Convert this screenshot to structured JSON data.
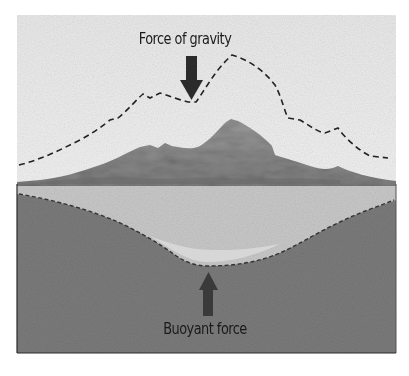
{
  "diagram": {
    "type": "isostasy-cross-section",
    "labels": {
      "gravity": "Force of gravity",
      "buoyant": "Buoyant force"
    },
    "arrows": [
      {
        "name": "gravity-arrow",
        "direction": "down"
      },
      {
        "name": "buoyant-arrow",
        "direction": "up"
      }
    ],
    "layers": [
      {
        "name": "sky",
        "color": "#ececec"
      },
      {
        "name": "mountain",
        "color": "#8c8c8c"
      },
      {
        "name": "crust",
        "color": "#c8c8c8"
      },
      {
        "name": "mantle",
        "color": "#7a7a7a"
      }
    ],
    "colors": {
      "arrow": "#2b2b2b",
      "dashed_line": "#222222",
      "frame": "#333333"
    }
  }
}
